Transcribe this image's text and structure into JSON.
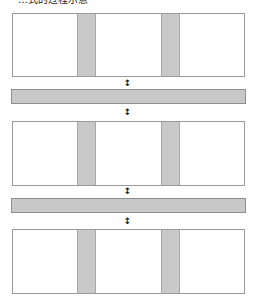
{
  "title": "…式的过程示意",
  "connector_icon": "↕",
  "colors": {
    "block_border": "#9a9a9a",
    "stripe_fill": "#c9c9c9",
    "bar_fill": "#c8c8c8",
    "bar_border": "#8e8e8e"
  },
  "layers": [
    {
      "type": "block",
      "stripes": 2
    },
    {
      "type": "bar"
    },
    {
      "type": "block",
      "stripes": 2
    },
    {
      "type": "bar"
    },
    {
      "type": "block",
      "stripes": 2
    }
  ]
}
